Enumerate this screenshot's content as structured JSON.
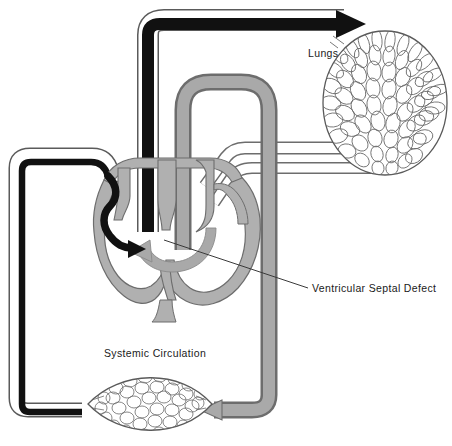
{
  "figure": {
    "title_visible": false,
    "background_color": "#ffffff"
  },
  "labels": {
    "lungs": "Lungs",
    "systemic": "Systemic Circulation",
    "vsd": "Ventricular Septal Defect"
  },
  "colors": {
    "deoxygenated_blood": "#111111",
    "oxygenated_blood": "#a9a9a9",
    "vessel_outline": "#4a4a4a",
    "capillary_outline": "#5a5a5a",
    "leader_line": "#3a3a3a",
    "background": "#ffffff",
    "text": "#1a1a1a"
  },
  "structures": {
    "lungs_bed": "pulmonary-capillary-bed",
    "systemic_bed": "systemic-capillary-bed",
    "heart": "heart-cross-section",
    "pulmonary_artery": "pulmonary-artery-black",
    "aorta": "aortic-arch-gray",
    "pulmonary_vein": "pulmonary-vein-gray",
    "vena_cava": "vena-cava-black"
  },
  "arrows": {
    "to_lungs": "black-arrow-right-into-lungs",
    "vena_cava_into_right_ventricle": "black-curved-arrow",
    "shunt_across_septum": "gray-curved-arrow-left",
    "aorta_to_systemic": "gray-arrow-into-systemic-bed"
  }
}
